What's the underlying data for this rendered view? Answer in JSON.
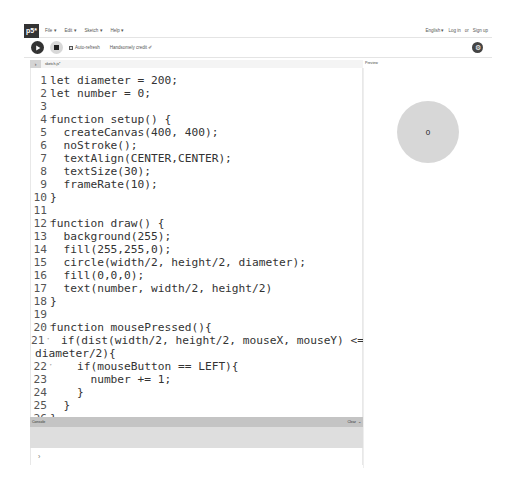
{
  "nav": {
    "logo": "p5*",
    "menu": [
      "File ▾",
      "Edit ▾",
      "Sketch ▾",
      "Help ▾"
    ],
    "language": "English ▾",
    "login": "Log in",
    "or": "or",
    "signup": "Sign up"
  },
  "toolbar": {
    "auto_refresh_label": "Auto-refresh",
    "auto_refresh_checked": true,
    "sketch_name": "Handsomely credit ✐"
  },
  "tabs": {
    "collapse_icon": "›",
    "file": "sketch.js*"
  },
  "preview": {
    "label": "Preview",
    "circle_text": "0"
  },
  "editor": {
    "lines": [
      {
        "n": "1",
        "code": "let diameter = 200;"
      },
      {
        "n": "2",
        "code": "let number = 0;"
      },
      {
        "n": "3",
        "code": ""
      },
      {
        "n": "4",
        "code": "function setup() {"
      },
      {
        "n": "5",
        "code": "  createCanvas(400, 400);"
      },
      {
        "n": "6",
        "code": "  noStroke();"
      },
      {
        "n": "7",
        "code": "  textAlign(CENTER,CENTER);"
      },
      {
        "n": "8",
        "code": "  textSize(30);"
      },
      {
        "n": "9",
        "code": "  frameRate(10);"
      },
      {
        "n": "10",
        "code": "}"
      },
      {
        "n": "11",
        "code": ""
      },
      {
        "n": "12",
        "code": "function draw() {"
      },
      {
        "n": "13",
        "code": "  background(255);"
      },
      {
        "n": "14",
        "code": "  fill(255,255,0);"
      },
      {
        "n": "15",
        "code": "  circle(width/2, height/2, diameter);"
      },
      {
        "n": "16",
        "code": "  fill(0,0,0);"
      },
      {
        "n": "17",
        "code": "  text(number, width/2, height/2)"
      },
      {
        "n": "18",
        "code": "}"
      },
      {
        "n": "19",
        "code": ""
      },
      {
        "n": "20",
        "code": "function mousePressed(){"
      },
      {
        "n": "21",
        "code": "  if(dist(width/2, height/2, mouseX, mouseY) <="
      },
      {
        "n": "",
        "code": "diameter/2){"
      },
      {
        "n": "22",
        "code": "    if(mouseButton == LEFT){"
      },
      {
        "n": "23",
        "code": "      number += 1;"
      },
      {
        "n": "24",
        "code": "    }"
      },
      {
        "n": "25",
        "code": "  }"
      },
      {
        "n": "26",
        "code": "}"
      }
    ]
  },
  "console": {
    "title": "Console",
    "clear_label": "Clear",
    "chevron": "⌄",
    "prompt": "›"
  }
}
